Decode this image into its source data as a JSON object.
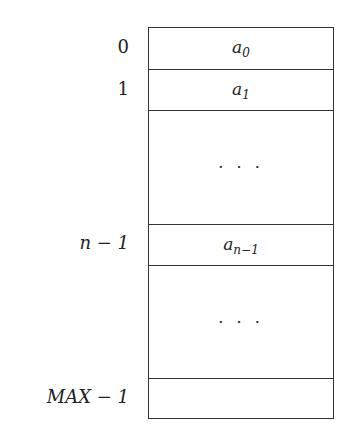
{
  "diagram": {
    "type": "array-memory-layout",
    "rows": [
      {
        "index": "0",
        "content_base": "a",
        "content_sub": "0",
        "kind": "element"
      },
      {
        "index": "1",
        "content_base": "a",
        "content_sub": "1",
        "kind": "element"
      },
      {
        "index": "",
        "content": "· · ·",
        "kind": "ellipsis"
      },
      {
        "index": "n − 1",
        "content_base": "a",
        "content_sub": "n−1",
        "kind": "element"
      },
      {
        "index": "",
        "content": "· · ·",
        "kind": "ellipsis"
      },
      {
        "index": "MAX − 1",
        "content": "",
        "kind": "empty"
      }
    ]
  }
}
